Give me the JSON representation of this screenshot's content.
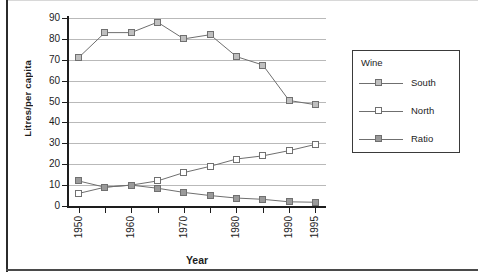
{
  "chart_data": {
    "type": "line",
    "title": "",
    "xlabel": "Year",
    "ylabel": "Litres/per capita",
    "x": [
      1950,
      1955,
      1960,
      1965,
      1970,
      1975,
      1980,
      1985,
      1990,
      1995
    ],
    "xtick_labels": [
      "1950",
      "1960",
      "1970",
      "1980",
      "1990",
      "1995"
    ],
    "xtick_values": [
      1950,
      1960,
      1970,
      1980,
      1990,
      1995
    ],
    "xlim": [
      1948,
      1997
    ],
    "ylim": [
      0,
      90
    ],
    "ytick_labels": [
      "0",
      "10",
      "20",
      "30",
      "40",
      "50",
      "60",
      "70",
      "80",
      "90"
    ],
    "ytick_values": [
      0,
      10,
      20,
      30,
      40,
      50,
      60,
      70,
      80,
      90
    ],
    "grid": "horizontal",
    "legend_position": "right-outside",
    "legend_title": "Wine",
    "series": [
      {
        "name": "South",
        "marker": "square",
        "marker_fill": "#bfbfbf",
        "line_color": "#6f6f6f",
        "values": [
          71,
          83,
          83,
          88,
          80,
          82,
          71.5,
          67.5,
          50.5,
          48.5
        ]
      },
      {
        "name": "North",
        "marker": "square",
        "marker_fill": "#ffffff",
        "line_color": "#6f6f6f",
        "values": [
          6,
          9,
          10,
          12,
          16,
          19,
          22.5,
          24,
          26.5,
          29.5
        ]
      },
      {
        "name": "Ratio",
        "marker": "square",
        "marker_fill": "#9a9a9a",
        "line_color": "#6f6f6f",
        "values": [
          12,
          9,
          10,
          8.5,
          6.5,
          5,
          3.8,
          3.2,
          2,
          1.8
        ]
      }
    ]
  },
  "legend": {
    "title": "Wine",
    "entries": [
      {
        "label": "South"
      },
      {
        "label": "North"
      },
      {
        "label": "Ratio"
      }
    ]
  },
  "axes": {
    "x_title": "Year",
    "y_title": "Litres/per capita"
  },
  "colors": {
    "axis": "#1d1d1d",
    "grid": "#b9b9b9",
    "line": "#6f6f6f",
    "south_fill": "#bfbfbf",
    "north_fill": "#ffffff",
    "ratio_fill": "#9a9a9a",
    "frame": "#2b2b2b"
  }
}
